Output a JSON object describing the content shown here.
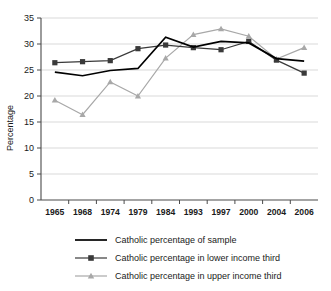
{
  "chart_data": {
    "type": "line",
    "title": "",
    "xlabel": "",
    "ylabel": "Percentage",
    "categories": [
      "1965",
      "1968",
      "1974",
      "1979",
      "1984",
      "1993",
      "1997",
      "2000",
      "2004",
      "2006"
    ],
    "ylim": [
      0,
      35
    ],
    "ytick_values": [
      "0",
      "5",
      "10",
      "15",
      "20",
      "25",
      "30",
      "35"
    ],
    "grid": true,
    "legend_position": "bottom",
    "series": [
      {
        "name": "Catholic percentage of sample",
        "color": "#000000",
        "marker": "none",
        "values": [
          24.6,
          23.9,
          24.9,
          25.3,
          31.3,
          29.4,
          30.5,
          30.2,
          27.2,
          26.7
        ]
      },
      {
        "name": "Catholic percentage in lower income third",
        "color": "#3a3a3a",
        "marker": "square",
        "values": [
          26.4,
          26.6,
          26.8,
          29.1,
          29.8,
          29.3,
          28.9,
          30.5,
          26.9,
          24.4
        ]
      },
      {
        "name": "Catholic percentage in upper income third",
        "color": "#a8a8a8",
        "marker": "triangle",
        "values": [
          19.2,
          16.4,
          22.7,
          20.0,
          27.3,
          31.8,
          32.9,
          31.5,
          27.1,
          29.3
        ]
      }
    ]
  }
}
